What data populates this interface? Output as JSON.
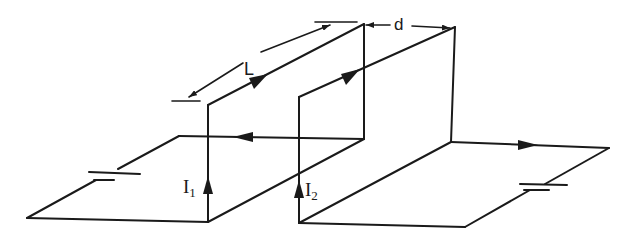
{
  "diagram": {
    "labels": {
      "length": "L",
      "separation": "d",
      "current1": "I",
      "current1_sub": "1",
      "current2": "I",
      "current2_sub": "2"
    },
    "colors": {
      "line": "#1a1a1a",
      "background": "#ffffff"
    },
    "components": [
      {
        "name": "loop-1",
        "current": "I1",
        "battery": "left"
      },
      {
        "name": "loop-2",
        "current": "I2",
        "battery": "right"
      }
    ]
  }
}
